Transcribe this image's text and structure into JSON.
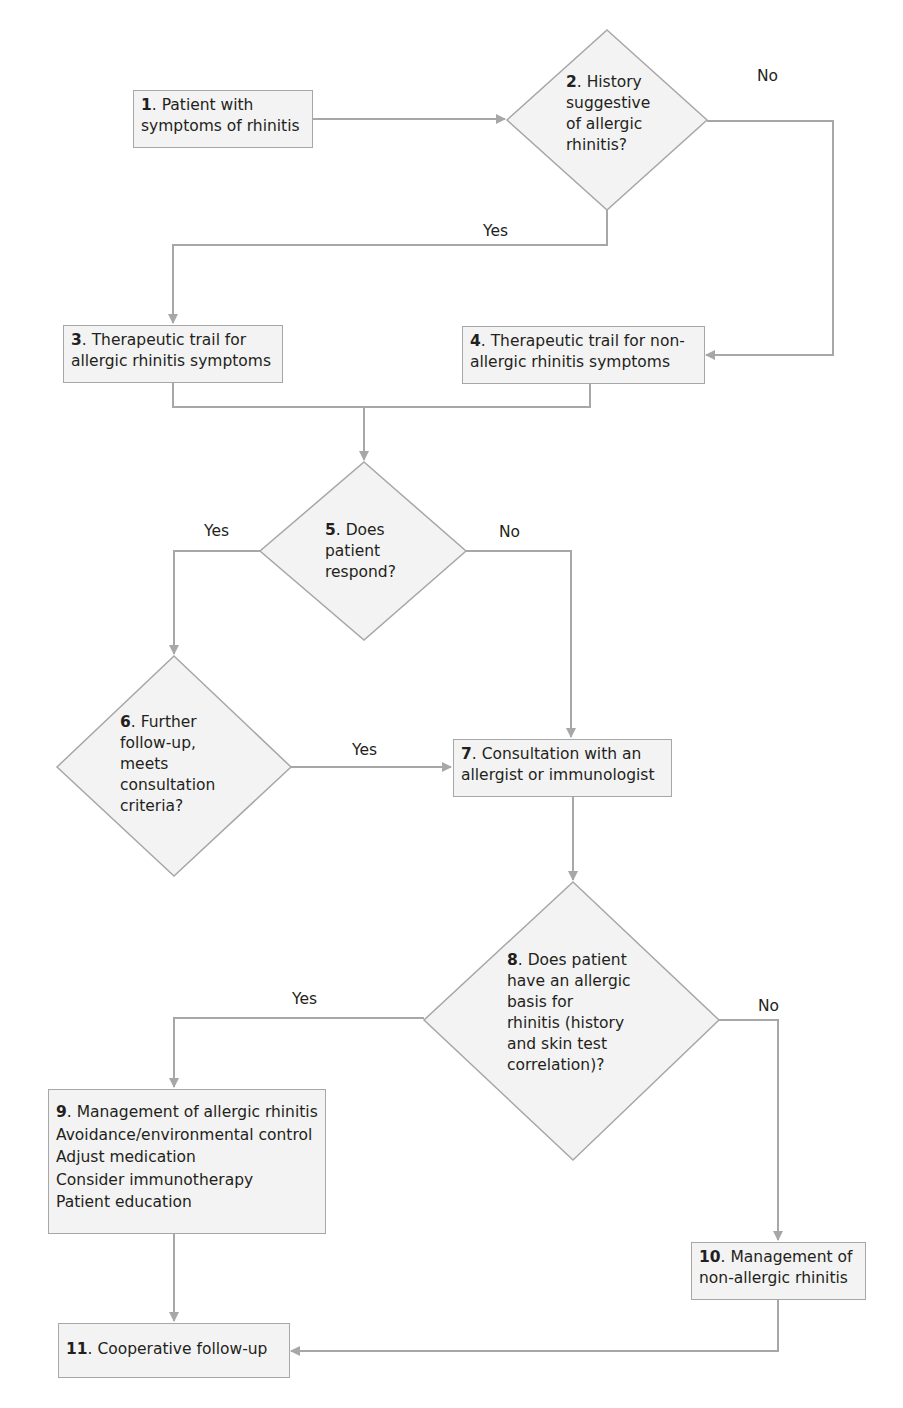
{
  "colors": {
    "line": "#a7a7a7",
    "fill": "#f3f3f3",
    "text": "#231f20"
  },
  "nodes": {
    "n1": {
      "num": "1",
      "text": ". Patient with",
      "line2": "symptoms of rhinitis"
    },
    "n2": {
      "num": "2",
      "text": ". History",
      "lines": [
        "suggestive",
        "of allergic",
        "rhinitis?"
      ]
    },
    "n3": {
      "num": "3",
      "text": ". Therapeutic trail for",
      "line2": "allergic rhinitis symptoms"
    },
    "n4": {
      "num": "4",
      "text": ". Therapeutic trail for non-",
      "line2": "allergic rhinitis symptoms"
    },
    "n5": {
      "num": "5",
      "text": ". Does",
      "lines": [
        "patient",
        "respond?"
      ]
    },
    "n6": {
      "num": "6",
      "text": ". Further",
      "lines": [
        "follow-up,",
        "meets",
        "consultation",
        "criteria?"
      ]
    },
    "n7": {
      "num": "7",
      "text": ". Consultation with an",
      "line2": "allergist or immunologist"
    },
    "n8": {
      "num": "8",
      "text": ". Does patient",
      "lines": [
        "have an allergic",
        "basis for",
        "rhinitis (history",
        "and skin test",
        "correlation)?"
      ]
    },
    "n9": {
      "num": "9",
      "text": ". Management of allergic rhinitis",
      "lines": [
        "Avoidance/environmental control",
        "Adjust medication",
        "Consider immunotherapy",
        "Patient education"
      ]
    },
    "n10": {
      "num": "10",
      "text": ". Management of",
      "line2": "non-allergic rhinitis"
    },
    "n11": {
      "num": "11",
      "text": ". Cooperative follow-up"
    }
  },
  "edges": {
    "n2_no": "No",
    "n2_yes": "Yes",
    "n5_yes": "Yes",
    "n5_no": "No",
    "n6_yes": "Yes",
    "n8_yes": "Yes",
    "n8_no": "No"
  }
}
